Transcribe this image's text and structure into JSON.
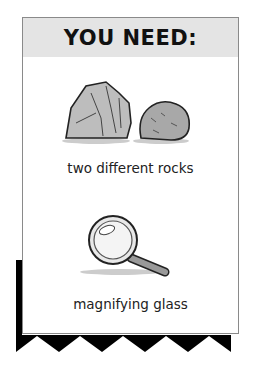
{
  "header": {
    "title": "YOU NEED:"
  },
  "items": [
    {
      "label": "two different rocks",
      "icon": "rocks-illustration"
    },
    {
      "label": "magnifying glass",
      "icon": "magnifying-glass-illustration"
    }
  ],
  "colors": {
    "header_bg": "#e4e4e4",
    "shadow": "#000000",
    "border": "#8a8a8a"
  }
}
